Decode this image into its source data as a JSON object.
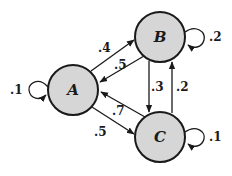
{
  "diagram": {
    "type": "markov-chain",
    "nodes": [
      {
        "id": "A",
        "label": "A",
        "cx": 73,
        "cy": 90,
        "r": 25
      },
      {
        "id": "B",
        "label": "B",
        "cx": 160,
        "cy": 37,
        "r": 25
      },
      {
        "id": "C",
        "label": "C",
        "cx": 160,
        "cy": 137,
        "r": 25
      }
    ],
    "edges": [
      {
        "from": "A",
        "to": "A",
        "label": ".1"
      },
      {
        "from": "A",
        "to": "B",
        "label": ".4"
      },
      {
        "from": "B",
        "to": "A",
        "label": ".5"
      },
      {
        "from": "A",
        "to": "C",
        "label": ".5"
      },
      {
        "from": "C",
        "to": "A",
        "label": ".7"
      },
      {
        "from": "B",
        "to": "C",
        "label": ".3"
      },
      {
        "from": "C",
        "to": "B",
        "label": ".2"
      },
      {
        "from": "B",
        "to": "B",
        "label": ".2"
      },
      {
        "from": "C",
        "to": "C",
        "label": ".1"
      }
    ],
    "colors": {
      "node_fill": "#d6d6d6",
      "stroke": "#1a1a1a",
      "background": "#ffffff"
    }
  }
}
